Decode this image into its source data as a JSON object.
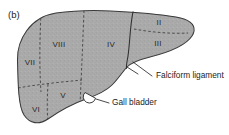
{
  "figure": {
    "panel_label": "(b)",
    "fill_color": "#a9a9a9",
    "outline_color": "#3a3a3a",
    "text_color": "#1c1c1c",
    "background_color": "#ffffff"
  },
  "segments": [
    {
      "id": "segment-vii",
      "label": "VII",
      "x": 30,
      "y": 63
    },
    {
      "id": "segment-viii",
      "label": "VIII",
      "x": 59,
      "y": 45
    },
    {
      "id": "segment-iv",
      "label": "IV",
      "x": 111,
      "y": 45
    },
    {
      "id": "segment-ii",
      "label": "II",
      "x": 159,
      "y": 23
    },
    {
      "id": "segment-iii",
      "label": "III",
      "x": 158,
      "y": 44
    },
    {
      "id": "segment-v",
      "label": "V",
      "x": 63,
      "y": 96
    },
    {
      "id": "segment-vi",
      "label": "VI",
      "x": 36,
      "y": 110
    }
  ],
  "annotations": [
    {
      "id": "falciform-ligament",
      "label": "Falciform ligament",
      "text_x": 156,
      "text_y": 76
    },
    {
      "id": "gall-bladder",
      "label": "Gall bladder",
      "text_x": 112,
      "text_y": 103
    }
  ]
}
